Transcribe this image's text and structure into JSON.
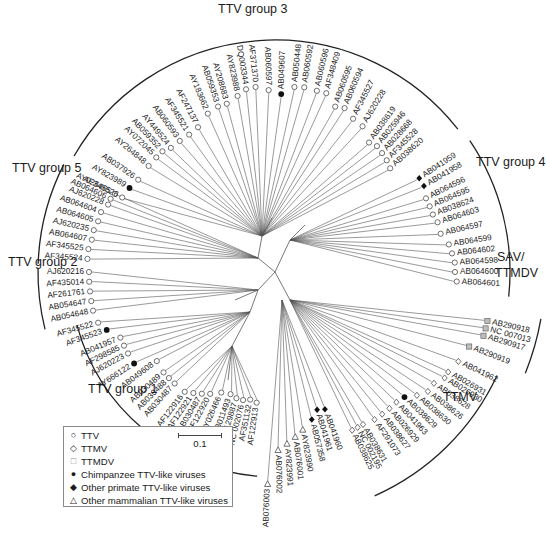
{
  "figure": {
    "type": "unrooted phylogenetic tree",
    "root": {
      "x": 275,
      "y": 272
    }
  },
  "group_labels": [
    {
      "id": "ttv-group-3",
      "text": "TTV group 3",
      "x": 218,
      "y": 2
    },
    {
      "id": "ttv-group-4",
      "text": "TTV group 4",
      "x": 476,
      "y": 155
    },
    {
      "id": "ttv-group-5",
      "text": "TTV group 5",
      "x": 12,
      "y": 161
    },
    {
      "id": "ttv-group-2",
      "text": "TTV group 2",
      "x": 8,
      "y": 255
    },
    {
      "id": "ttv-group-1",
      "text": "TTV group 1",
      "x": 88,
      "y": 382
    },
    {
      "id": "sav-ttmdv-line1",
      "text": "SAV/",
      "x": 497,
      "y": 250
    },
    {
      "id": "sav-ttmdv-line2",
      "text": "TTMDV",
      "x": 495,
      "y": 266
    },
    {
      "id": "ttmv",
      "text": "TTMV",
      "x": 443,
      "y": 390
    }
  ],
  "legend": {
    "items": [
      {
        "symbol": "open-circle",
        "glyph": "○",
        "label": "TTV"
      },
      {
        "symbol": "open-diamond",
        "glyph": "◇",
        "label": "TTMV"
      },
      {
        "symbol": "grey-square",
        "glyph": "□",
        "label": "TTMDV"
      },
      {
        "symbol": "filled-circle",
        "glyph": "●",
        "label": "Chimpanzee TTV-like viruses"
      },
      {
        "symbol": "filled-diamond",
        "glyph": "◆",
        "label": "Other primate TTV-like viruses"
      },
      {
        "symbol": "open-triangle",
        "glyph": "△",
        "label": "Other mammalian TTV-like viruses"
      }
    ],
    "scale_bar": {
      "label": "0.1"
    }
  },
  "taxa": [
    {
      "label": "AB037926",
      "ang": 214,
      "r": 165,
      "sym": "open-circle",
      "grp": 3
    },
    {
      "label": "AY823989",
      "ang": 210,
      "r": 168,
      "sym": "filled-circle",
      "grp": 3
    },
    {
      "label": "AF345526",
      "ang": 206,
      "r": 170,
      "sym": "open-circle",
      "grp": 3
    },
    {
      "label": "AY264848",
      "ang": 220,
      "r": 165,
      "sym": "open-circle",
      "grp": 3
    },
    {
      "label": "AY072045",
      "ang": 224,
      "r": 165,
      "sym": "open-circle",
      "grp": 3
    },
    {
      "label": "AB059352",
      "ang": 227,
      "r": 165,
      "sym": "open-circle",
      "grp": 3
    },
    {
      "label": "AY449524",
      "ang": 230,
      "r": 162,
      "sym": "open-circle",
      "grp": 3
    },
    {
      "label": "AB060593",
      "ang": 234,
      "r": 162,
      "sym": "open-circle",
      "grp": 3
    },
    {
      "label": "AF345521",
      "ang": 238,
      "r": 162,
      "sym": "open-circle",
      "grp": 3
    },
    {
      "label": "AF247137",
      "ang": 242,
      "r": 164,
      "sym": "open-circle",
      "grp": 3
    },
    {
      "label": "AY183662",
      "ang": 247,
      "r": 172,
      "sym": "open-circle",
      "grp": 3
    },
    {
      "label": "AB059353",
      "ang": 251,
      "r": 175,
      "sym": "open-circle",
      "grp": 3
    },
    {
      "label": "AY208683",
      "ang": 254,
      "r": 175,
      "sym": "open-circle",
      "grp": 3
    },
    {
      "label": "AY823988",
      "ang": 258,
      "r": 180,
      "sym": "open-circle",
      "grp": 3
    },
    {
      "label": "DQ003344",
      "ang": 261,
      "r": 185,
      "sym": "open-circle",
      "grp": 3
    },
    {
      "label": "AF371370",
      "ang": 264,
      "r": 186,
      "sym": "open-circle",
      "grp": 3
    },
    {
      "label": "AB060597",
      "ang": 268,
      "r": 182,
      "sym": "open-circle",
      "grp": 3
    },
    {
      "label": "AB049607",
      "ang": 272,
      "r": 178,
      "sym": "filled-circle",
      "grp": 3
    },
    {
      "label": "AB050448",
      "ang": 276,
      "r": 186,
      "sym": "open-circle",
      "grp": 3
    },
    {
      "label": "AB060592",
      "ang": 279,
      "r": 187,
      "sym": "open-circle",
      "grp": 3
    },
    {
      "label": "AB060596",
      "ang": 283,
      "r": 186,
      "sym": "open-circle",
      "grp": 3
    },
    {
      "label": "AF348409",
      "ang": 286,
      "r": 186,
      "sym": "open-circle",
      "grp": 3
    },
    {
      "label": "AB060595",
      "ang": 290,
      "r": 176,
      "sym": "open-circle",
      "grp": 3
    },
    {
      "label": "AB060594",
      "ang": 293,
      "r": 178,
      "sym": "open-circle",
      "grp": 3
    },
    {
      "label": "AF345527",
      "ang": 297,
      "r": 172,
      "sym": "open-circle",
      "grp": 3
    },
    {
      "label": "AJ620228",
      "ang": 301,
      "r": 170,
      "sym": "open-circle",
      "grp": 3
    },
    {
      "label": "AB038619",
      "ang": 306,
      "r": 160,
      "sym": "open-circle",
      "grp": 3
    },
    {
      "label": "AB025946",
      "ang": 309,
      "r": 162,
      "sym": "open-circle",
      "grp": 3
    },
    {
      "label": "AB028668",
      "ang": 312,
      "r": 160,
      "sym": "open-circle",
      "grp": 3
    },
    {
      "label": "AF345528",
      "ang": 315,
      "r": 158,
      "sym": "open-circle",
      "grp": 3
    },
    {
      "label": "AB038620",
      "ang": 318,
      "r": 155,
      "sym": "open-circle",
      "grp": 3
    },
    {
      "label": "AB041959",
      "ang": 327,
      "r": 172,
      "sym": "filled-diamond",
      "grp": 4
    },
    {
      "label": "AB041958",
      "ang": 330,
      "r": 172,
      "sym": "filled-diamond",
      "grp": 4
    },
    {
      "label": "AB064596",
      "ang": 334,
      "r": 168,
      "sym": "open-circle",
      "grp": 4
    },
    {
      "label": "AB064595",
      "ang": 337,
      "r": 168,
      "sym": "open-circle",
      "grp": 4
    },
    {
      "label": "AB038624",
      "ang": 340,
      "r": 168,
      "sym": "open-circle",
      "grp": 4
    },
    {
      "label": "AB064603",
      "ang": 343,
      "r": 170,
      "sym": "open-circle",
      "grp": 4
    },
    {
      "label": "AB064597",
      "ang": 347,
      "r": 170,
      "sym": "open-circle",
      "grp": 4
    },
    {
      "label": "AB064599",
      "ang": 351,
      "r": 176,
      "sym": "open-circle",
      "grp": 4
    },
    {
      "label": "AB064602",
      "ang": 354,
      "r": 178,
      "sym": "open-circle",
      "grp": 4
    },
    {
      "label": "AB064598",
      "ang": 357,
      "r": 180,
      "sym": "open-circle",
      "grp": 4
    },
    {
      "label": "AB064600",
      "ang": 0,
      "r": 180,
      "sym": "open-circle",
      "grp": 4
    },
    {
      "label": "AB064601",
      "ang": 3,
      "r": 182,
      "sym": "open-circle",
      "grp": 4
    },
    {
      "label": "AB290918",
      "ang": 13,
      "r": 218,
      "sym": "grey-square",
      "grp": "sav"
    },
    {
      "label": "NC 007013",
      "ang": 15,
      "r": 218,
      "sym": "grey-square",
      "grp": "sav"
    },
    {
      "label": "AB290917",
      "ang": 17,
      "r": 218,
      "sym": "grey-square",
      "grp": "sav"
    },
    {
      "label": "AB290919",
      "ang": 21,
      "r": 208,
      "sym": "grey-square",
      "grp": "sav"
    },
    {
      "label": "AB041962",
      "ang": 26,
      "r": 204,
      "sym": "open-diamond",
      "grp": "ttmv"
    },
    {
      "label": "AB026931",
      "ang": 30,
      "r": 200,
      "sym": "open-diamond",
      "grp": "ttmv"
    },
    {
      "label": "AB026930",
      "ang": 32,
      "r": 200,
      "sym": "open-diamond",
      "grp": "ttmv"
    },
    {
      "label": "AB038628",
      "ang": 35,
      "r": 194,
      "sym": "open-diamond",
      "grp": "ttmv"
    },
    {
      "label": "AB038626",
      "ang": 38,
      "r": 194,
      "sym": "open-diamond",
      "grp": "ttmv"
    },
    {
      "label": "AB038630",
      "ang": 41,
      "r": 188,
      "sym": "open-diamond",
      "grp": "ttmv"
    },
    {
      "label": "AB038629",
      "ang": 44,
      "r": 180,
      "sym": "filled-circle",
      "grp": "ttmv"
    },
    {
      "label": "AB041963",
      "ang": 47,
      "r": 178,
      "sym": "open-diamond",
      "grp": "ttmv"
    },
    {
      "label": "AB026929",
      "ang": 50,
      "r": 178,
      "sym": "open-diamond",
      "grp": "ttmv"
    },
    {
      "label": "AB038627",
      "ang": 53,
      "r": 178,
      "sym": "open-diamond",
      "grp": "ttmv"
    },
    {
      "label": "AF291073",
      "ang": 56,
      "r": 178,
      "sym": "open-diamond",
      "grp": "ttmv"
    },
    {
      "label": "AB038631",
      "ang": 60,
      "r": 176,
      "sym": "open-diamond",
      "grp": "ttmv"
    },
    {
      "label": "NC 002195",
      "ang": 62,
      "r": 176,
      "sym": "open-diamond",
      "grp": "ttmv"
    },
    {
      "label": "AB038625",
      "ang": 64,
      "r": 176,
      "sym": "open-diamond",
      "grp": "ttmv"
    },
    {
      "label": "AB041960",
      "ang": 70,
      "r": 146,
      "sym": "filled-diamond",
      "grp": "other"
    },
    {
      "label": "AB041961",
      "ang": 73,
      "r": 144,
      "sym": "filled-diamond",
      "grp": "other"
    },
    {
      "label": "AB057358",
      "ang": 76,
      "r": 152,
      "sym": "filled-diamond",
      "grp": "other"
    },
    {
      "label": "AY823990",
      "ang": 80,
      "r": 160,
      "sym": "open-triangle",
      "grp": "other"
    },
    {
      "label": "AB076001",
      "ang": 83,
      "r": 166,
      "sym": "open-triangle",
      "grp": "other"
    },
    {
      "label": "AY823991",
      "ang": 86,
      "r": 172,
      "sym": "open-triangle",
      "grp": "other"
    },
    {
      "label": "AB076002",
      "ang": 89,
      "r": 178,
      "sym": "open-triangle",
      "grp": "other"
    },
    {
      "label": "AB076003",
      "ang": 92,
      "r": 212,
      "sym": "open-triangle",
      "grp": "other"
    },
    {
      "label": "AF122913",
      "ang": 98,
      "r": 132,
      "sym": "open-circle",
      "grp": 1
    },
    {
      "label": "AF351132",
      "ang": 101,
      "r": 130,
      "sym": "open-circle",
      "grp": 1
    },
    {
      "label": "NC 002076",
      "ang": 104,
      "r": 132,
      "sym": "open-circle",
      "grp": 1
    },
    {
      "label": "AF129887",
      "ang": 107,
      "r": 132,
      "sym": "open-circle",
      "grp": 1
    },
    {
      "label": "AB011493",
      "ang": 110,
      "r": 130,
      "sym": "open-circle",
      "grp": 1
    },
    {
      "label": "AY026466",
      "ang": 114,
      "r": 132,
      "sym": "open-circle",
      "grp": 1
    },
    {
      "label": "AF122920",
      "ang": 118,
      "r": 138,
      "sym": "open-circle",
      "grp": 1
    },
    {
      "label": "AB030487",
      "ang": 121,
      "r": 142,
      "sym": "open-circle",
      "grp": 1
    },
    {
      "label": "AF122921",
      "ang": 124,
      "r": 146,
      "sym": "open-circle",
      "grp": 1
    },
    {
      "label": "AF122916",
      "ang": 127,
      "r": 150,
      "sym": "open-circle",
      "grp": 1
    },
    {
      "label": "AB030487",
      "ang": 132,
      "r": 150,
      "sym": "open-circle",
      "grp": 1
    },
    {
      "label": "AB030488",
      "ang": 135,
      "r": 150,
      "sym": "open-circle",
      "grp": 1
    },
    {
      "label": "AB030489",
      "ang": 138,
      "r": 150,
      "sym": "open-circle",
      "grp": 1
    },
    {
      "label": "AB049608",
      "ang": 143,
      "r": 148,
      "sym": "open-circle",
      "grp": 1
    },
    {
      "label": "AY666122",
      "ang": 147,
      "r": 168,
      "sym": "filled-circle",
      "grp": 1
    },
    {
      "label": "AJ620223",
      "ang": 151,
      "r": 168,
      "sym": "open-circle",
      "grp": 1
    },
    {
      "label": "AF298585",
      "ang": 154,
      "r": 168,
      "sym": "open-circle",
      "grp": 1
    },
    {
      "label": "AB041957",
      "ang": 157,
      "r": 168,
      "sym": "open-circle",
      "grp": 1
    },
    {
      "label": "AF345523",
      "ang": 161,
      "r": 178,
      "sym": "filled-circle",
      "grp": 1
    },
    {
      "label": "AF345522",
      "ang": 164,
      "r": 184,
      "sym": "open-circle",
      "grp": 1
    },
    {
      "label": "AB054648",
      "ang": 168,
      "r": 186,
      "sym": "open-circle",
      "grp": 2
    },
    {
      "label": "AB054647",
      "ang": 171,
      "r": 186,
      "sym": "open-circle",
      "grp": 2
    },
    {
      "label": "AF261761",
      "ang": 174,
      "r": 186,
      "sym": "open-circle",
      "grp": 2
    },
    {
      "label": "AF435014",
      "ang": 177,
      "r": 186,
      "sym": "open-circle",
      "grp": 2
    },
    {
      "label": "AJ620216",
      "ang": 180,
      "r": 186,
      "sym": "open-circle",
      "grp": 2
    },
    {
      "label": "AF345524",
      "ang": 184,
      "r": 188,
      "sym": "open-circle",
      "grp": 5
    },
    {
      "label": "AF345525",
      "ang": 187,
      "r": 188,
      "sym": "open-circle",
      "grp": 5
    },
    {
      "label": "AB064607",
      "ang": 190,
      "r": 186,
      "sym": "open-circle",
      "grp": 5
    },
    {
      "label": "AJ620235",
      "ang": 193,
      "r": 186,
      "sym": "open-circle",
      "grp": 5
    },
    {
      "label": "AB064605",
      "ang": 196,
      "r": 184,
      "sym": "open-circle",
      "grp": 5
    },
    {
      "label": "AB064604",
      "ang": 199,
      "r": 184,
      "sym": "open-circle",
      "grp": 5
    },
    {
      "label": "AJ620228",
      "ang": 202,
      "r": 180,
      "sym": "open-circle",
      "grp": 5
    },
    {
      "label": "AB064606",
      "ang": 204,
      "r": 180,
      "sym": "open-circle",
      "grp": 5
    },
    {
      "label": "AY026465",
      "ang": 206,
      "r": 178,
      "sym": "open-circle",
      "grp": 5
    }
  ],
  "internal_branches": [
    {
      "from": [
        275,
        272
      ],
      "to": [
        258,
        258
      ]
    },
    {
      "from": [
        258,
        258
      ],
      "to": [
        262,
        236
      ]
    },
    {
      "from": [
        262,
        236
      ],
      "to": [
        272,
        218
      ]
    },
    {
      "from": [
        275,
        272
      ],
      "to": [
        290,
        240
      ]
    },
    {
      "from": [
        290,
        240
      ],
      "to": [
        305,
        225
      ]
    },
    {
      "from": [
        275,
        272
      ],
      "to": [
        258,
        290
      ]
    },
    {
      "from": [
        258,
        290
      ],
      "to": [
        250,
        312
      ]
    },
    {
      "from": [
        258,
        290
      ],
      "to": [
        235,
        300
      ]
    },
    {
      "from": [
        250,
        312
      ],
      "to": [
        232,
        346
      ]
    },
    {
      "from": [
        232,
        346
      ],
      "to": [
        228,
        380
      ]
    },
    {
      "from": [
        275,
        272
      ],
      "to": [
        290,
        300
      ]
    }
  ],
  "arcs": [
    {
      "id": "arc-ttv3",
      "cx": 275,
      "cy": 272,
      "r": 232,
      "a0": 210,
      "a1": 322
    },
    {
      "id": "arc-ttv4",
      "cx": 275,
      "cy": 272,
      "r": 235,
      "a0": 326,
      "a1": 6
    },
    {
      "id": "arc-sav",
      "cx": 275,
      "cy": 272,
      "r": 270,
      "a0": 10,
      "a1": 22
    },
    {
      "id": "arc-ttmv",
      "cx": 275,
      "cy": 272,
      "r": 245,
      "a0": 25,
      "a1": 66
    },
    {
      "id": "arc-ttv5",
      "cx": 275,
      "cy": 272,
      "r": 237,
      "a0": 182,
      "a1": 207
    },
    {
      "id": "arc-ttv2",
      "cx": 275,
      "cy": 272,
      "r": 237,
      "a0": 166,
      "a1": 181
    },
    {
      "id": "arc-ttv1",
      "cx": 275,
      "cy": 272,
      "r": 205,
      "a0": 95,
      "a1": 165
    }
  ]
}
